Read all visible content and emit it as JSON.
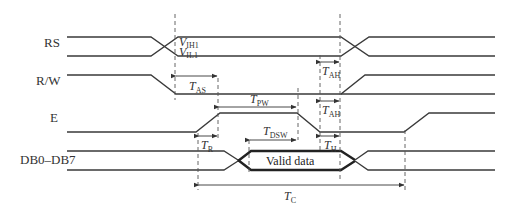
{
  "diagram": {
    "type": "timing-diagram",
    "signals": [
      {
        "name": "RS"
      },
      {
        "name": "R/W"
      },
      {
        "name": "E"
      },
      {
        "name": "DB0–DB7"
      }
    ],
    "levels": {
      "high": "V",
      "high_sub": "IH1",
      "low": "V",
      "low_sub": "IL1"
    },
    "data_label": "Valid data",
    "timings": {
      "tas": {
        "main": "T",
        "sub": "AS"
      },
      "tah1": {
        "main": "T",
        "sub": "AH"
      },
      "tpw": {
        "main": "T",
        "sub": "PW"
      },
      "tah2": {
        "main": "T",
        "sub": "AH"
      },
      "tr": {
        "main": "T",
        "sub": "R"
      },
      "tdsw": {
        "main": "T",
        "sub": "DSW"
      },
      "th": {
        "main": "T",
        "sub": "H"
      },
      "tc": {
        "main": "T",
        "sub": "C"
      }
    }
  }
}
